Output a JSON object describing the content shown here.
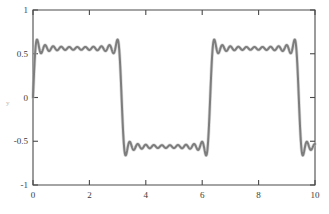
{
  "chart_data": {
    "type": "line",
    "title": "",
    "subtitle": "",
    "xlabel": "",
    "ylabel": "y",
    "xlim": [
      0,
      10
    ],
    "ylim": [
      -1,
      1
    ],
    "grid": false,
    "legend": null,
    "xticks": [
      0,
      2,
      4,
      6,
      8,
      10
    ],
    "xtick_labels": [
      "0",
      "2",
      "4",
      "6",
      "8",
      "10"
    ],
    "yticks": [
      -1,
      -0.5,
      0,
      0.5,
      1
    ],
    "ytick_labels": [
      "-1",
      "-0.5",
      "0",
      "0.5",
      "1"
    ],
    "series": [
      {
        "name": "square-wave-fourier-partial-sum",
        "color": "#7d7d7d",
        "linewidth": 2.0,
        "harmonics": 21,
        "odd_harmonic_count": 11,
        "amplitude": 0.85,
        "period": 6.2832,
        "plateau_high": 0.82,
        "plateau_low": -0.82,
        "overshoot_high": 0.99,
        "overshoot_low": -0.99,
        "discontinuities": [
          3.1416,
          6.2832,
          9.4248
        ]
      }
    ],
    "axis_tick_labels_visible": true,
    "background_color": "#ffffff",
    "frame_color": "#4a4a4a"
  },
  "figure": {
    "ylabel_text": "y"
  }
}
